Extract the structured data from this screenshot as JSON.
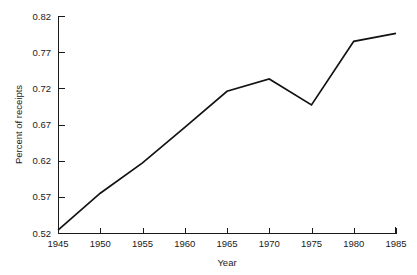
{
  "chart_data": {
    "type": "line",
    "title": "",
    "xlabel": "Year",
    "ylabel": "Percent of receipts",
    "x": [
      1945,
      1950,
      1955,
      1960,
      1965,
      1970,
      1975,
      1980,
      1985
    ],
    "values": [
      0.524,
      0.575,
      0.617,
      0.666,
      0.716,
      0.733,
      0.697,
      0.785,
      0.796
    ],
    "series": [
      {
        "name": "Percent of receipts",
        "values": [
          0.524,
          0.575,
          0.617,
          0.666,
          0.716,
          0.733,
          0.697,
          0.785,
          0.796
        ]
      }
    ],
    "xlim": [
      1945,
      1985
    ],
    "ylim": [
      0.52,
      0.82
    ],
    "xticks": [
      1945,
      1950,
      1955,
      1960,
      1965,
      1970,
      1975,
      1980,
      1985
    ],
    "yticks": [
      0.52,
      0.57,
      0.62,
      0.67,
      0.72,
      0.77,
      0.82
    ],
    "xtick_labels": [
      "1945",
      "1950",
      "1955",
      "1960",
      "1965",
      "1970",
      "1975",
      "1980",
      "1985"
    ],
    "ytick_labels": [
      "0.52",
      "0.57",
      "0.62",
      "0.67",
      "0.72",
      "0.77",
      "0.82"
    ],
    "grid": false,
    "legend": false,
    "legend_position": "none",
    "line_color": "#121212",
    "background_color": "#ffffff"
  }
}
